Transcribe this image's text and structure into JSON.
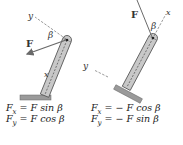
{
  "diagrams": [
    {
      "id": "left",
      "labels": {
        "force": "F",
        "angle": "β",
        "x_axis": "x",
        "y_axis": "y"
      },
      "equations": {
        "fx": {
          "lhs": "F",
          "sub": "x",
          "rhs": "= F sin β"
        },
        "fy": {
          "lhs": "F",
          "sub": "y",
          "rhs": "= F cos β"
        }
      }
    },
    {
      "id": "right",
      "labels": {
        "force": "F",
        "angle": "β",
        "x_axis": "x",
        "y_axis": "y"
      },
      "equations": {
        "fx": {
          "lhs": "F",
          "sub": "x",
          "rhs": "= − F cos β"
        },
        "fy": {
          "lhs": "F",
          "sub": "y",
          "rhs": "= − F sin β"
        }
      }
    }
  ],
  "colors": {
    "bar_fill": "#c8c8c8",
    "bar_stroke": "#555555",
    "base_fill": "#9a9a9a",
    "force_arrow": "#6a6a6a",
    "dashed_axis": "#555555",
    "text": "#222222"
  }
}
